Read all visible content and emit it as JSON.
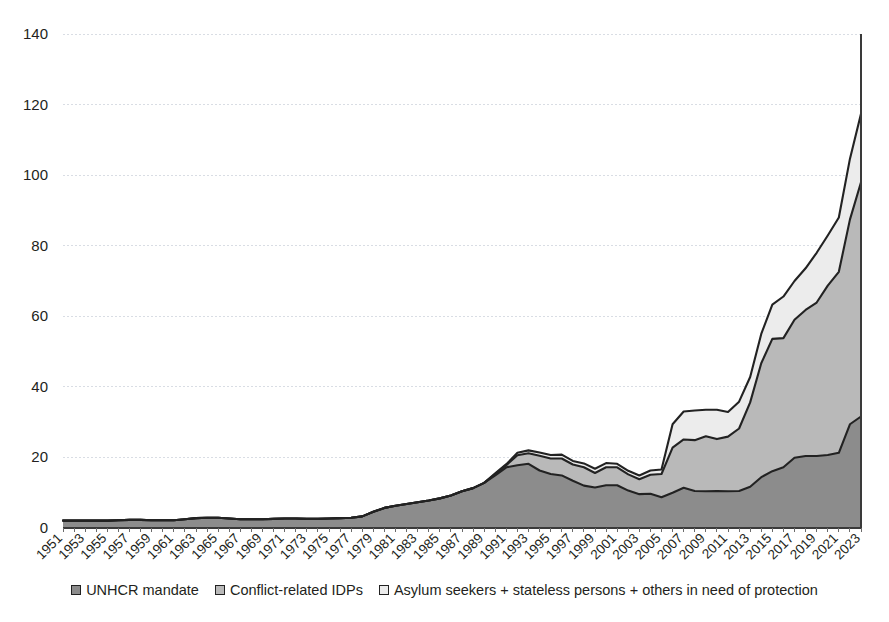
{
  "chart_data": {
    "type": "area",
    "stacked": true,
    "title": "",
    "subtitle": "",
    "xlabel": "",
    "ylabel": "",
    "ylim": [
      0,
      140
    ],
    "ytick_step": 20,
    "yticks": [
      0,
      20,
      40,
      60,
      80,
      100,
      120,
      140
    ],
    "grid": true,
    "grid_axis": "y",
    "legend_position": "bottom",
    "x_tick_interval": 2,
    "x_label_rotation": -45,
    "x": [
      1951,
      1952,
      1953,
      1954,
      1955,
      1956,
      1957,
      1958,
      1959,
      1960,
      1961,
      1962,
      1963,
      1964,
      1965,
      1966,
      1967,
      1968,
      1969,
      1970,
      1971,
      1972,
      1973,
      1974,
      1975,
      1976,
      1977,
      1978,
      1979,
      1980,
      1981,
      1982,
      1983,
      1984,
      1985,
      1986,
      1987,
      1988,
      1989,
      1990,
      1991,
      1992,
      1993,
      1994,
      1995,
      1996,
      1997,
      1998,
      1999,
      2000,
      2001,
      2002,
      2003,
      2004,
      2005,
      2006,
      2007,
      2008,
      2009,
      2010,
      2011,
      2012,
      2013,
      2014,
      2015,
      2016,
      2017,
      2018,
      2019,
      2020,
      2021,
      2022,
      2023
    ],
    "xticks": [
      1951,
      1953,
      1955,
      1957,
      1959,
      1961,
      1963,
      1965,
      1967,
      1969,
      1971,
      1973,
      1975,
      1977,
      1979,
      1981,
      1983,
      1985,
      1987,
      1989,
      1991,
      1993,
      1995,
      1997,
      1999,
      2001,
      2003,
      2005,
      2007,
      2009,
      2011,
      2013,
      2015,
      2017,
      2019,
      2021,
      2023
    ],
    "xticklabels": [
      "1951",
      "1953",
      "1955",
      "1957",
      "1959",
      "1961",
      "1963",
      "1965",
      "1967",
      "1969",
      "1971",
      "1973",
      "1975",
      "1977",
      "1979",
      "1981",
      "1983",
      "1985",
      "1987",
      "1989",
      "1991",
      "1993",
      "1995",
      "1997",
      "1999",
      "2001",
      "2003",
      "2005",
      "2007",
      "2009",
      "2011",
      "2013",
      "2015",
      "2017",
      "2019",
      "2021",
      "2023"
    ],
    "series": [
      {
        "name": "UNHCR mandate",
        "color": "#8c8c8c",
        "values": [
          2.1,
          2.1,
          2.1,
          2.1,
          2.1,
          2.2,
          2.3,
          2.3,
          2.2,
          2.2,
          2.2,
          2.5,
          2.8,
          2.9,
          2.9,
          2.7,
          2.5,
          2.5,
          2.5,
          2.6,
          2.7,
          2.7,
          2.6,
          2.6,
          2.7,
          2.8,
          2.9,
          3.3,
          4.6,
          5.7,
          6.3,
          6.8,
          7.3,
          7.8,
          8.4,
          9.2,
          10.4,
          11.3,
          12.8,
          14.9,
          17.2,
          17.8,
          18.2,
          16.3,
          15.3,
          14.9,
          13.4,
          12.0,
          11.5,
          12.1,
          12.1,
          10.6,
          9.6,
          9.7,
          8.7,
          10.0,
          11.4,
          10.5,
          10.4,
          10.5,
          10.4,
          10.5,
          11.7,
          14.4,
          16.1,
          17.2,
          19.9,
          20.4,
          20.4,
          20.7,
          21.3,
          29.4,
          31.6
        ]
      },
      {
        "name": "Conflict-related IDPs",
        "color": "#b9b9b9",
        "values": [
          0,
          0,
          0,
          0,
          0,
          0,
          0,
          0,
          0,
          0,
          0,
          0,
          0,
          0,
          0,
          0,
          0,
          0,
          0,
          0,
          0,
          0,
          0,
          0,
          0,
          0,
          0,
          0,
          0,
          0,
          0,
          0,
          0,
          0,
          0,
          0,
          0,
          0,
          0,
          0.4,
          0.6,
          2.8,
          3.0,
          4.2,
          4.4,
          4.8,
          4.6,
          5.2,
          4.1,
          5.1,
          5.1,
          4.6,
          4.2,
          5.4,
          6.6,
          12.8,
          13.7,
          14.4,
          15.6,
          14.7,
          15.5,
          17.7,
          23.9,
          32.3,
          37.5,
          36.6,
          39.1,
          41.4,
          43.5,
          48.0,
          51.3,
          58.0,
          66.4
        ]
      },
      {
        "name": "Asylum seekers + stateless persons + others in need of protection",
        "color": "#ececec",
        "values": [
          0,
          0,
          0,
          0,
          0,
          0,
          0,
          0,
          0,
          0,
          0,
          0,
          0,
          0,
          0,
          0,
          0,
          0,
          0,
          0,
          0,
          0,
          0,
          0,
          0,
          0,
          0,
          0,
          0,
          0,
          0,
          0,
          0,
          0,
          0,
          0,
          0,
          0,
          0,
          0.2,
          0.3,
          0.7,
          0.8,
          0.9,
          1.0,
          1.1,
          1.0,
          1.1,
          1.2,
          1.2,
          1.0,
          1.0,
          1.1,
          1.2,
          1.3,
          6.6,
          7.9,
          8.4,
          7.5,
          8.3,
          7.0,
          7.6,
          7.2,
          8.3,
          9.7,
          11.8,
          11.0,
          11.8,
          14.1,
          14.2,
          15.4,
          17.2,
          19.4
        ]
      }
    ]
  },
  "legend": {
    "items": [
      {
        "label": "UNHCR mandate",
        "color": "#8c8c8c"
      },
      {
        "label": "Conflict-related IDPs",
        "color": "#b9b9b9"
      },
      {
        "label": "Asylum seekers + stateless persons + others in need of protection",
        "color": "#ececec"
      }
    ]
  }
}
